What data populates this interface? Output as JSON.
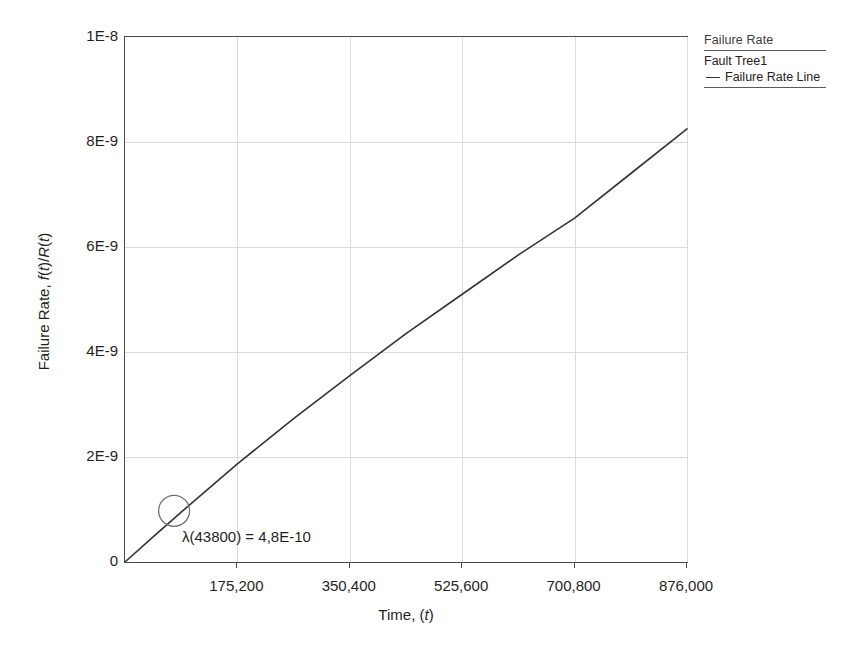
{
  "chart_data": {
    "type": "line",
    "title": "",
    "xlabel": "Time, (t)",
    "ylabel": "Failure Rate, f(t)/R(t)",
    "xlim": [
      0,
      876000
    ],
    "ylim": [
      0,
      1e-08
    ],
    "grid": true,
    "legend_position": "right",
    "xticks": [
      175200,
      350400,
      525600,
      700800,
      876000
    ],
    "xticklabels": [
      "175,200",
      "350,400",
      "525,600",
      "700,800",
      "876,000"
    ],
    "yticks": [
      0,
      2e-09,
      4e-09,
      6e-09,
      8e-09,
      1e-08
    ],
    "yticklabels": [
      "0",
      "2E-9",
      "4E-9",
      "6E-9",
      "8E-9",
      "1E-8"
    ],
    "series": [
      {
        "name": "Failure Rate Line",
        "color": "#333333",
        "x": [
          0,
          43800,
          87600,
          175200,
          262800,
          350400,
          438000,
          525600,
          613200,
          700800,
          788400,
          876000
        ],
        "y": [
          0,
          4.8e-10,
          9.5e-10,
          1.87e-09,
          2.73e-09,
          3.55e-09,
          4.35e-09,
          5.1e-09,
          5.85e-09,
          6.55e-09,
          7.4e-09,
          8.25e-09
        ]
      }
    ],
    "annotations": [
      {
        "text": "λ(43800) = 4,8E-10",
        "marker": "circle",
        "x": 43800,
        "y": 4.8e-10
      }
    ]
  },
  "axes": {
    "y_title_parts": {
      "prefix": "Failure Rate, ",
      "f": "f",
      "open": "(",
      "t1": "t",
      "close_slash": ")/",
      "R": "R",
      "open2": "(",
      "t2": "t",
      "close2": ")"
    },
    "x_title_parts": {
      "prefix": "Time, (",
      "t": "t",
      "suffix": ")"
    }
  },
  "legend": {
    "title": "Failure Rate",
    "group": "Fault Tree1",
    "entries": [
      {
        "label": "Failure Rate Line"
      }
    ]
  },
  "annotation": {
    "lambda_text": "λ(43800) = 4,8E-10"
  },
  "colors": {
    "line": "#333333",
    "grid": "#dcdcdc",
    "frame": "#4a4a4a",
    "text": "#1f1f1f",
    "legend_text": "#3d3d3d"
  }
}
